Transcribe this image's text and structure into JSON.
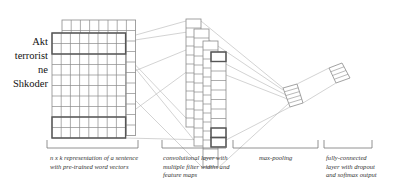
{
  "words": [
    "Akt",
    "terrorist",
    "ne",
    "Shkoder"
  ],
  "captions": [
    {
      "text": "n x k representation of a sentence with pre-trained word vectors",
      "x": 50,
      "y": 154,
      "w": 92
    },
    {
      "text": "convolutional layer with multiple filter widths and feature maps",
      "x": 163,
      "y": 154,
      "w": 70
    },
    {
      "text": "max-pooling",
      "x": 259,
      "y": 154,
      "w": 60
    },
    {
      "text": "fully-connected layer with dropout and softmax output",
      "x": 326,
      "y": 154,
      "w": 52
    }
  ],
  "colors": {
    "grid": "#8a8a8a",
    "highlight": "#555555",
    "connector": "#b5b5b5",
    "bracket": "#777777"
  },
  "sentence_matrix": {
    "back": {
      "x": 62,
      "y": 20,
      "cols": 8,
      "rows": 11,
      "cw": 9.2,
      "rh": 10.5
    },
    "front": {
      "x": 52,
      "y": 33,
      "cols": 8,
      "rows": 10,
      "cw": 9.2,
      "rh": 10.5
    },
    "highlights": [
      {
        "row": 0,
        "span": 2
      },
      {
        "row": 8,
        "span": 2
      }
    ]
  },
  "conv_columns": [
    {
      "x": 186,
      "y": 19,
      "w": 15,
      "rows": 12,
      "rh": 9
    },
    {
      "x": 194,
      "y": 29,
      "w": 15,
      "rows": 13,
      "rh": 9
    },
    {
      "x": 203,
      "y": 41,
      "w": 15,
      "rows": 14,
      "rh": 9
    },
    {
      "x": 211,
      "y": 52,
      "w": 15,
      "rows": 10,
      "rh": 9.5,
      "highlights": [
        0,
        8,
        9
      ]
    }
  ],
  "brackets": [
    {
      "x1": 47,
      "x2": 138,
      "y": 148
    },
    {
      "x1": 162,
      "x2": 226,
      "y": 148
    },
    {
      "x1": 233,
      "x2": 318,
      "y": 148
    },
    {
      "x1": 324,
      "x2": 372,
      "y": 148
    }
  ]
}
